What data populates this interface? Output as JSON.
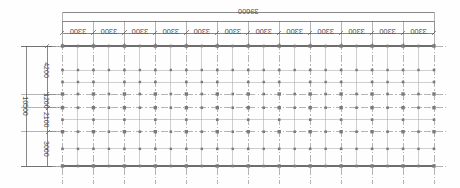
{
  "drawing": {
    "title": "structural-column-grid-plan",
    "orientation_note": "all dimension text rendered rotated 180 degrees",
    "units": "mm",
    "colors": {
      "background": "#fefefe",
      "grid_line": "#8c8c8c",
      "node": "#7a7a7a",
      "dimension_line": "#555555",
      "text": "#4a4a4a",
      "outline": "#6e6e6e"
    }
  },
  "top_dimension_chain": {
    "overall_label": "39600",
    "bay_count": 12,
    "bay_labels": [
      "3300",
      "3300",
      "3300",
      "3300",
      "3300",
      "3300",
      "3300",
      "3300",
      "3300",
      "3300",
      "3300",
      "3300"
    ],
    "bay_value": 3300,
    "total_value": 39600
  },
  "left_dimension_chain": {
    "overall_label": "10500",
    "total_value": 10500,
    "segment_labels": [
      "4200",
      "1200",
      "2100",
      "3000"
    ],
    "segment_values": [
      4200,
      1200,
      2100,
      3000
    ]
  },
  "plan_geometry": {
    "x_grid_mm": [
      0,
      3300,
      6600,
      9900,
      13200,
      16500,
      19800,
      23100,
      26400,
      29700,
      33000,
      36300,
      39600
    ],
    "y_grid_mm": [
      0,
      4200,
      5400,
      7500,
      10500
    ],
    "x_intermediate_mm": [
      1650,
      4950,
      8250,
      11550,
      14850,
      18150,
      21450,
      24750,
      28050,
      31350,
      34650,
      37950
    ],
    "y_intermediate_mm": [
      2100,
      3150,
      6450,
      9000
    ],
    "note": "primary grid intersections carry column nodes; secondary beam nodes at mid-bay"
  }
}
